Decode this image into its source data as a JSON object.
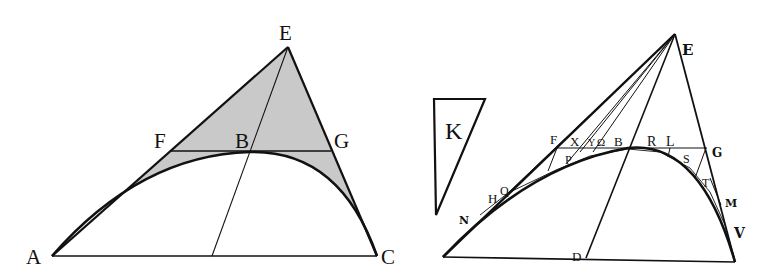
{
  "figures": [
    {
      "id": "left-figure",
      "description": "Triangle AEC with parabola-like arc from A through B to C; line FG tangent at B; segment from E through B to base; shaded region between arc and triangle sides above",
      "colors": {
        "stroke": "#111111",
        "shade": "#c8c8c8"
      },
      "points": {
        "A": [
          52,
          256
        ],
        "C": [
          377,
          256
        ],
        "E": [
          288,
          47
        ],
        "F": [
          171,
          150
        ],
        "G": [
          331,
          150
        ],
        "B": [
          250,
          152
        ],
        "D": [
          212,
          256
        ]
      },
      "labels": [
        {
          "text": "A",
          "x": 26,
          "y": 264
        },
        {
          "text": "C",
          "x": 381,
          "y": 264
        },
        {
          "text": "E",
          "x": 279,
          "y": 40
        },
        {
          "text": "F",
          "x": 154,
          "y": 148
        },
        {
          "text": "B",
          "x": 235,
          "y": 148
        },
        {
          "text": "G",
          "x": 334,
          "y": 148
        }
      ]
    },
    {
      "id": "right-figure",
      "description": "Woodcut-style triangle with curve from base-left through B to V; many rays from E to points on the curve; inscribed small triangles; auxiliary triangle K",
      "colors": {
        "stroke": "#111111"
      },
      "points": {
        "base_left": [
          443,
          257
        ],
        "base_right": [
          735,
          262
        ],
        "E": [
          675,
          34
        ],
        "F": [
          557,
          148
        ],
        "G": [
          706,
          148
        ],
        "B": [
          628,
          148
        ],
        "D": [
          586,
          258
        ]
      },
      "labels": [
        {
          "text": "E",
          "x": 682,
          "y": 55
        },
        {
          "text": "K",
          "x": 445,
          "y": 139
        },
        {
          "text": "F",
          "x": 550,
          "y": 144
        },
        {
          "text": "X",
          "x": 570,
          "y": 146
        },
        {
          "text": "Y",
          "x": 588,
          "y": 146
        },
        {
          "text": "Ω",
          "x": 597,
          "y": 146
        },
        {
          "text": "B",
          "x": 614,
          "y": 146
        },
        {
          "text": "R",
          "x": 647,
          "y": 146
        },
        {
          "text": "L",
          "x": 666,
          "y": 146
        },
        {
          "text": "G",
          "x": 712,
          "y": 157
        },
        {
          "text": "P",
          "x": 565,
          "y": 164
        },
        {
          "text": "S",
          "x": 683,
          "y": 163
        },
        {
          "text": "T",
          "x": 702,
          "y": 187
        },
        {
          "text": "H",
          "x": 488,
          "y": 203
        },
        {
          "text": "Q",
          "x": 500,
          "y": 195
        },
        {
          "text": "N",
          "x": 459,
          "y": 224
        },
        {
          "text": "M",
          "x": 725,
          "y": 207
        },
        {
          "text": "V",
          "x": 734,
          "y": 238
        },
        {
          "text": "D",
          "x": 572,
          "y": 261
        }
      ]
    }
  ]
}
